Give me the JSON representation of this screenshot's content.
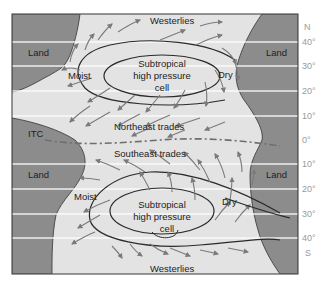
{
  "colors": {
    "land": "#8c8c8c",
    "ocean": "#e3e3e3",
    "latitude_line": "#ffffff",
    "arrow": "#7a7a7a",
    "isobar": "#2a2a2a",
    "itc_line": "#6e6e6e",
    "label": "#222222",
    "lat_label": "#9a9a9a",
    "frame": "#555555"
  },
  "labels": {
    "westerlies_north": "Westerlies",
    "westerlies_south": "Westerlies",
    "land_nw": "Land",
    "land_ne": "Land",
    "land_sw": "Land",
    "land_se": "Land",
    "moist_north": "Moist",
    "moist_south": "Moist",
    "dry_north": "Dry",
    "dry_south": "Dry",
    "high_north": [
      "Subtropical",
      "high pressure",
      "cell"
    ],
    "high_south": [
      "Subtropical",
      "high pressure",
      "cell"
    ],
    "northeast_trades": "Northeast trades",
    "southeast_trades": "Southeast trades",
    "itc": "ITC"
  },
  "latitude_axis": {
    "north_label": "N",
    "south_label": "S",
    "ticks": [
      "40°",
      "30°",
      "20°",
      "10°",
      "0°",
      "10°",
      "20°",
      "30°",
      "40°"
    ]
  }
}
